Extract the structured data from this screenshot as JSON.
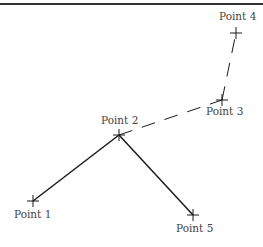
{
  "diagram": {
    "points": [
      {
        "label": "Point 1",
        "x": 33,
        "y": 201,
        "lx": 14,
        "ly": 218
      },
      {
        "label": "Point 2",
        "x": 119,
        "y": 135,
        "lx": 101,
        "ly": 124
      },
      {
        "label": "Point 3",
        "x": 222,
        "y": 100,
        "lx": 206,
        "ly": 115
      },
      {
        "label": "Point 4",
        "x": 236,
        "y": 33,
        "lx": 219,
        "ly": 20
      },
      {
        "label": "Point 5",
        "x": 193,
        "y": 215,
        "lx": 176,
        "ly": 232
      }
    ],
    "solid_segments": [
      [
        "Point 1",
        "Point 2"
      ],
      [
        "Point 2",
        "Point 5"
      ]
    ],
    "dashed_segments": [
      [
        "Point 2",
        "Point 3"
      ],
      [
        "Point 3",
        "Point 4"
      ]
    ],
    "colors": {
      "line": "#1a1a1a",
      "label": "#444444",
      "border": "#333333"
    }
  }
}
